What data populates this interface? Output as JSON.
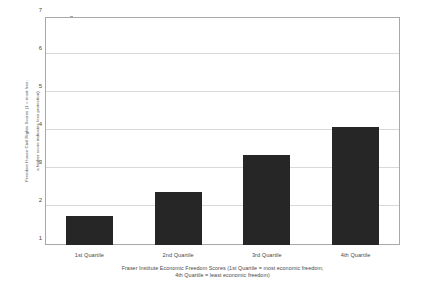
{
  "chart_data": {
    "type": "bar",
    "title": "",
    "categories": [
      "1st Quartile",
      "2nd Quartile",
      "3rd Quartile",
      "4th Quartile"
    ],
    "values": [
      1.76,
      2.39,
      3.37,
      4.11
    ],
    "series": [
      {
        "name": "Freedom House Civil Rights Score",
        "values": [
          1.76,
          2.39,
          3.37,
          4.11
        ]
      }
    ],
    "xlabel_line1": "Fraser Institute Economic Freedom Scores (1st Quartile = most economic freedom;",
    "xlabel_line2": "4th Quartile = least economic freedom)",
    "ylabel_line1": "Freedom House Civil Rights Scores (1 = most free;",
    "ylabel_line2": "a higher score indicates less protection)",
    "ylim": [
      1,
      7
    ],
    "yticks": [
      1,
      2,
      3,
      4,
      5,
      6,
      7
    ],
    "ytick_labels": [
      "1",
      "2",
      "3",
      "4",
      "5",
      "6",
      "7"
    ],
    "grid": true,
    "legend": "none",
    "bar_color": "#262626",
    "grid_color": "#d9d9d9",
    "frame_color": "#a8a8a8",
    "background_color": "#ffffff"
  }
}
